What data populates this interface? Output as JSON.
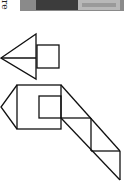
{
  "page": {
    "fragment_text": "re"
  },
  "figures": [
    {
      "name": "arrow-shape",
      "description": "left-pointing triangle split by a horizontal line, with a square attached on its right"
    },
    {
      "name": "house-chute-shape",
      "description": "square with inner square and left triangular point, connected to a diagonal band divided into triangles"
    }
  ],
  "colors": {
    "stroke": "#111111",
    "background": "#ffffff"
  }
}
